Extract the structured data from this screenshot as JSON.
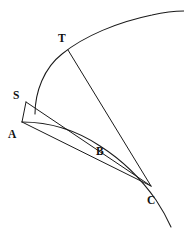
{
  "figure": {
    "kind": "geometry-diagram",
    "width": 184,
    "height": 241,
    "background_color": "#ffffff",
    "stroke_color": "#1a1a1a",
    "label_color": "#111111",
    "labels": [
      {
        "id": "T",
        "text": "T",
        "x": 58,
        "y": 33
      },
      {
        "id": "S",
        "text": "S",
        "x": 13,
        "y": 90
      },
      {
        "id": "A",
        "text": "A",
        "x": 8,
        "y": 129
      },
      {
        "id": "B",
        "text": "B",
        "x": 96,
        "y": 146
      },
      {
        "id": "C",
        "text": "C",
        "x": 147,
        "y": 195
      }
    ],
    "points": [
      {
        "id": "A",
        "x": 22,
        "y": 122
      },
      {
        "id": "S",
        "x": 26,
        "y": 102
      },
      {
        "id": "T",
        "x": 68,
        "y": 50
      },
      {
        "id": "B",
        "x": 104,
        "y": 139
      },
      {
        "id": "C",
        "x": 151,
        "y": 186
      }
    ],
    "curves": [
      {
        "id": "outer-arc-through-T",
        "name": "large-circular-arc",
        "path": "M 35 114 C 35 92 44 68 62 54 C 84 36 118 22 152 15 C 165 12 176 11 184 11"
      },
      {
        "id": "arc-A-B-C",
        "name": "small-arc-from-A-through-B-to-C",
        "path": "M 22 122 C 48 122 76 130 100 146 C 122 160 142 180 156 200 C 162 209 167 218 171 227"
      }
    ],
    "segments": [
      {
        "id": "A-S",
        "name": "segment-a-s",
        "x1": 22,
        "y1": 122,
        "x2": 26,
        "y2": 102
      },
      {
        "id": "S-C",
        "name": "segment-s-c",
        "x1": 26,
        "y1": 102,
        "x2": 151,
        "y2": 186
      },
      {
        "id": "A-C",
        "name": "segment-a-c",
        "x1": 22,
        "y1": 122,
        "x2": 151,
        "y2": 186
      },
      {
        "id": "T-C",
        "name": "segment-t-c",
        "x1": 68,
        "y1": 50,
        "x2": 151,
        "y2": 186
      }
    ]
  }
}
